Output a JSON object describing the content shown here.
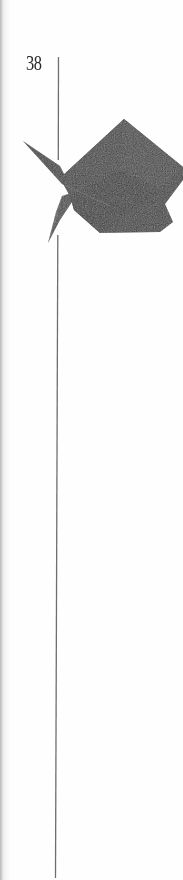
{
  "page": {
    "number": "38",
    "background_color": "#fefefe",
    "rule_color": "#6e6e6e"
  },
  "figure": {
    "fill_color": "#3c3c3c",
    "highlight_color": "#5a5a5a"
  }
}
